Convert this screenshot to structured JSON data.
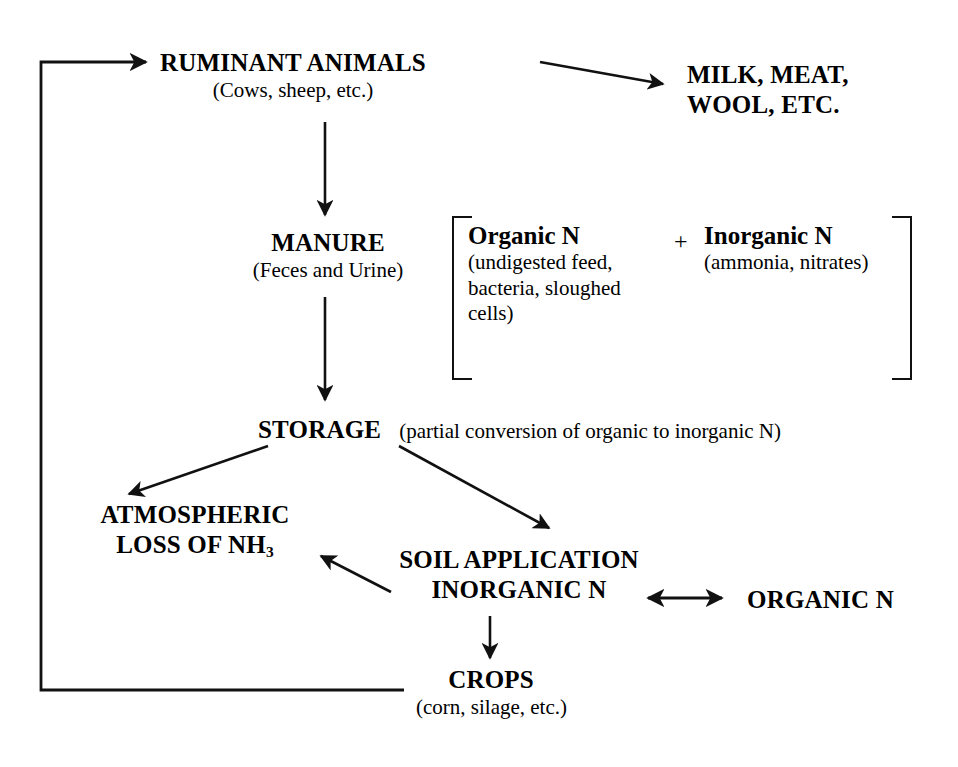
{
  "diagram": {
    "line_color": "#111111",
    "background": "#ffffff"
  },
  "nodes": {
    "ruminant": {
      "heading": "RUMINANT ANIMALS",
      "subtext": "(Cows, sheep, etc.)"
    },
    "products": {
      "line1": "MILK, MEAT,",
      "line2": "WOOL, ETC."
    },
    "manure": {
      "heading": "MANURE",
      "subtext": "(Feces and Urine)"
    },
    "manure_composition": {
      "organic_heading": "Organic N",
      "organic_subtext": "(undigested feed, bacteria, sloughed cells)",
      "plus": "+",
      "inorganic_heading": "Inorganic N",
      "inorganic_subtext": "(ammonia, nitrates)"
    },
    "storage": {
      "heading": "STORAGE",
      "note": "(partial conversion of organic to inorganic N)"
    },
    "atmospheric": {
      "line1": "ATMOSPHERIC",
      "line2_pre": "LOSS OF NH",
      "line2_sub": "3"
    },
    "soil": {
      "heading": "SOIL APPLICATION",
      "inorganic_label": "INORGANIC N"
    },
    "organic_right": {
      "label": "ORGANIC N"
    },
    "crops": {
      "heading": "CROPS",
      "subtext": "(corn, silage, etc.)"
    }
  },
  "arrows": [
    {
      "name": "ruminant-to-products",
      "from": "RUMINANT ANIMALS",
      "to": "MILK, MEAT, WOOL, ETC.",
      "style": "single"
    },
    {
      "name": "ruminant-to-manure",
      "from": "RUMINANT ANIMALS",
      "to": "MANURE",
      "style": "single"
    },
    {
      "name": "manure-to-storage",
      "from": "MANURE",
      "to": "STORAGE",
      "style": "single"
    },
    {
      "name": "storage-to-atmospheric",
      "from": "STORAGE",
      "to": "ATMOSPHERIC LOSS OF NH3",
      "style": "single"
    },
    {
      "name": "storage-to-soil",
      "from": "STORAGE",
      "to": "SOIL APPLICATION",
      "style": "single"
    },
    {
      "name": "inorganic-to-atmospheric",
      "from": "INORGANIC N",
      "to": "ATMOSPHERIC LOSS OF NH3",
      "style": "single"
    },
    {
      "name": "inorganic-organic-exchange",
      "from": "INORGANIC N",
      "to": "ORGANIC N",
      "style": "double"
    },
    {
      "name": "inorganic-to-crops",
      "from": "INORGANIC N",
      "to": "CROPS",
      "style": "single"
    },
    {
      "name": "crops-to-ruminant",
      "from": "CROPS",
      "to": "RUMINANT ANIMALS",
      "style": "single-elbow"
    }
  ]
}
